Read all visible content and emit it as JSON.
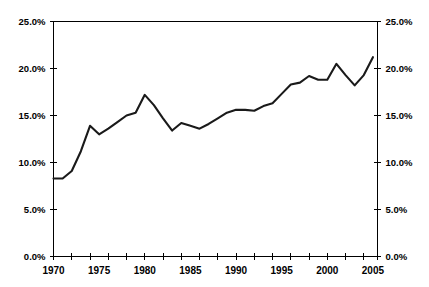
{
  "chart_data": {
    "type": "line",
    "title": "",
    "subtitle": "",
    "xlabel": "",
    "ylabel": "",
    "ylabel_right": "",
    "xlim": [
      1970,
      2005.5
    ],
    "ylim": [
      0,
      25
    ],
    "grid": false,
    "legend": false,
    "legend_position": "none",
    "y_tick_labels": [
      "0.0%",
      "5.0%",
      "10.0%",
      "15.0%",
      "20.0%",
      "25.0%"
    ],
    "y_tick_values": [
      0,
      5,
      10,
      15,
      20,
      25
    ],
    "y_tick_labels_right": [
      "0.0%",
      "5.0%",
      "10.0%",
      "15.0%",
      "20.0%",
      "25.0%"
    ],
    "y_tick_values_right": [
      0,
      5,
      10,
      15,
      20,
      25
    ],
    "x_tick_labels": [
      "1970",
      "1975",
      "1980",
      "1985",
      "1990",
      "1995",
      "2000",
      "2005"
    ],
    "x_tick_values": [
      1970,
      1975,
      1980,
      1985,
      1990,
      1995,
      2000,
      2005
    ],
    "x_minor_ticks": [
      1970,
      1972,
      1974,
      1976,
      1978,
      1980,
      1982,
      1984,
      1986,
      1988,
      1990,
      1992,
      1994,
      1996,
      1998,
      2000,
      2002,
      2004,
      2005.5
    ],
    "series": [
      {
        "name": "series-1",
        "color": "#1a1a1a",
        "x": [
          1970,
          1971,
          1972,
          1973,
          1974,
          1975,
          1976,
          1977,
          1978,
          1979,
          1980,
          1981,
          1982,
          1983,
          1984,
          1985,
          1986,
          1987,
          1988,
          1989,
          1990,
          1991,
          1992,
          1993,
          1994,
          1995,
          1996,
          1997,
          1998,
          1999,
          2000,
          2001,
          2002,
          2003,
          2004,
          2005
        ],
        "values": [
          8.3,
          8.3,
          9.1,
          11.2,
          13.9,
          13.0,
          13.6,
          14.3,
          15.0,
          15.3,
          17.2,
          16.1,
          14.7,
          13.4,
          14.2,
          13.9,
          13.6,
          14.1,
          14.7,
          15.3,
          15.6,
          15.6,
          15.5,
          16.0,
          16.3,
          17.3,
          18.3,
          18.5,
          19.2,
          18.8,
          18.8,
          20.5,
          19.3,
          18.2,
          19.3,
          21.2
        ]
      }
    ],
    "colors": {
      "line": "#1a1a1a",
      "axis": "#000000",
      "background": "#ffffff",
      "text": "#000000"
    }
  }
}
